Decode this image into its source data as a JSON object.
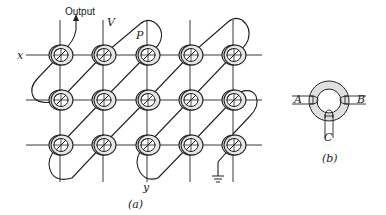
{
  "figure": {
    "part_a": {
      "caption": "(a)",
      "labels": {
        "output": "Output",
        "v": "V",
        "p": "P",
        "x": "x",
        "y": "y"
      },
      "grid": {
        "columns": [
          60,
          103,
          147,
          190,
          233
        ],
        "rows": [
          55,
          100,
          145
        ],
        "core_count": 15
      },
      "elements": [
        "toroidal ferrite cores",
        "x drive lines",
        "y drive lines",
        "diagonal sense winding",
        "output lead",
        "ground symbol"
      ]
    },
    "part_b": {
      "caption": "(b)",
      "labels": {
        "a": "A",
        "b": "B",
        "c": "C"
      },
      "elements": [
        "single toroid core with three windings"
      ]
    }
  },
  "colors": {
    "ink": "#222222",
    "core_fill": "#e6e6e6",
    "background": "#ffffff"
  }
}
